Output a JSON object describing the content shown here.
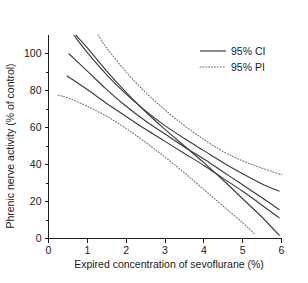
{
  "chart_data": {
    "type": "line",
    "title": "",
    "xlabel": "Expired concentration of sevoflurane (%)",
    "ylabel": "Phrenic nerve activity (% of control)",
    "xlim": [
      0,
      6
    ],
    "ylim": [
      0,
      110
    ],
    "xticks": [
      0,
      1,
      2,
      3,
      4,
      5,
      6
    ],
    "xtick_labels": [
      "0",
      "1",
      "2",
      "3",
      "4",
      "5",
      "6"
    ],
    "yticks": [
      0,
      20,
      40,
      60,
      80,
      100
    ],
    "ytick_labels": [
      "0",
      "20",
      "40",
      "60",
      "80",
      "100"
    ],
    "y_minor_ticks": [
      10,
      30,
      50,
      70,
      90
    ],
    "grid": false,
    "legend_position": "upper-right",
    "legend": [
      {
        "label": "95% CI",
        "style": "solid"
      },
      {
        "label": "95% PI",
        "style": "dotted"
      }
    ],
    "series": [
      {
        "name": "95% CI upper outer",
        "style": "solid",
        "x": [
          0.65,
          1.0,
          1.5,
          2.0,
          2.5,
          3.0,
          3.5,
          4.0,
          4.5,
          5.0,
          5.5,
          5.95
        ],
        "y": [
          110.0,
          100.5,
          88.5,
          78.0,
          69.0,
          61.0,
          54.0,
          47.5,
          41.0,
          35.0,
          29.5,
          25.5
        ]
      },
      {
        "name": "95% CI upper inner",
        "style": "solid",
        "x": [
          0.52,
          1.0,
          1.5,
          2.0,
          2.5,
          3.0,
          3.5,
          4.0,
          4.5,
          5.0,
          5.5,
          5.95
        ],
        "y": [
          100.0,
          90.5,
          80.5,
          71.5,
          63.5,
          56.5,
          49.5,
          43.0,
          36.0,
          29.0,
          22.0,
          15.5
        ]
      },
      {
        "name": "95% CI lower inner",
        "style": "solid",
        "x": [
          0.47,
          1.0,
          1.5,
          2.0,
          2.5,
          3.0,
          3.5,
          4.0,
          4.5,
          5.0,
          5.5,
          5.95
        ],
        "y": [
          88.0,
          80.5,
          73.0,
          66.0,
          59.0,
          52.5,
          46.0,
          39.5,
          32.5,
          25.5,
          18.0,
          11.0
        ]
      },
      {
        "name": "95% CI lower outer",
        "style": "solid",
        "x": [
          0.7,
          1.0,
          1.5,
          2.0,
          2.5,
          3.0,
          3.5,
          4.0,
          4.5,
          5.0,
          5.5,
          5.95
        ],
        "y": [
          110.0,
          103.0,
          90.5,
          79.0,
          68.5,
          59.0,
          50.0,
          41.0,
          31.5,
          21.5,
          11.5,
          1.5
        ]
      },
      {
        "name": "95% PI upper",
        "style": "dotted",
        "x": [
          1.28,
          1.5,
          2.0,
          2.5,
          3.0,
          3.5,
          4.0,
          4.5,
          5.0,
          5.5,
          6.0
        ],
        "y": [
          110.0,
          103.0,
          90.0,
          79.0,
          69.5,
          61.0,
          53.5,
          47.0,
          42.0,
          38.0,
          34.5
        ]
      },
      {
        "name": "95% PI lower",
        "style": "dotted",
        "x": [
          0.25,
          0.5,
          1.0,
          1.5,
          2.0,
          2.5,
          3.0,
          3.5,
          4.0,
          4.5,
          5.0,
          5.3
        ],
        "y": [
          77.5,
          76.0,
          71.5,
          66.0,
          59.5,
          52.0,
          44.0,
          35.5,
          26.5,
          17.5,
          8.5,
          2.5
        ]
      }
    ]
  }
}
